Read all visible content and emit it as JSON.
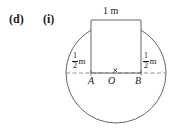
{
  "figure": {
    "part_label": "(d)",
    "subpart_label": "(i)",
    "top_dimension": "1 m",
    "left_dimension": {
      "numerator": "1",
      "denominator": "2",
      "unit": "m"
    },
    "right_dimension": {
      "numerator": "1",
      "denominator": "2",
      "unit": "m"
    },
    "points": {
      "left": "A",
      "centre": "O",
      "right": "B"
    },
    "centre_marker": "cross-marker",
    "colors": {
      "stroke": "#555555",
      "text": "#1a1a1a",
      "background": "#ffffff"
    },
    "geometry": {
      "centre_x": 116,
      "baseline_y": 73,
      "circle_radius": 50,
      "rect_left_x": 91,
      "rect_right_x": 141,
      "rect_top_y": 20
    }
  }
}
